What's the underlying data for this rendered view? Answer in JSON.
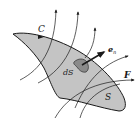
{
  "diagram": {
    "type": "flux-through-surface",
    "labels": {
      "boundary": "C",
      "surface": "S",
      "element": "dS",
      "normal": "e",
      "normal_sub": "n",
      "field": "F"
    },
    "colors": {
      "surface_fill": "#c4c4c4",
      "element_fill": "#8a8a8a",
      "line": "#1a1a1a",
      "background": "#ffffff"
    }
  }
}
